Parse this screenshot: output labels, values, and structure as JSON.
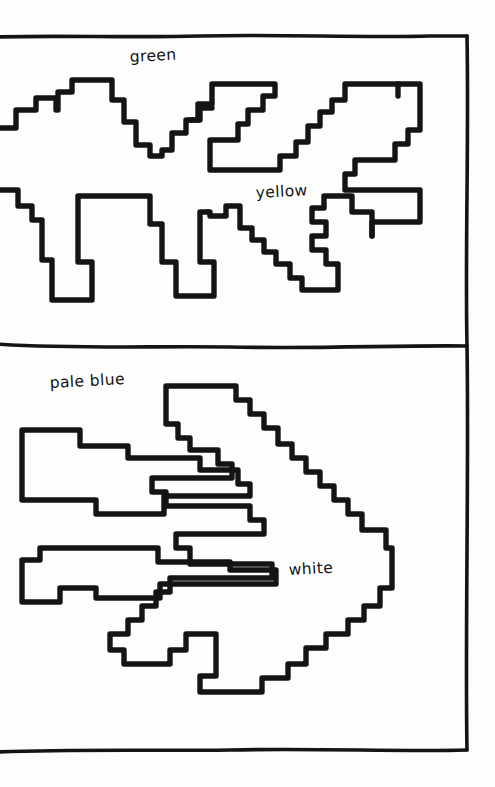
{
  "document": {
    "title": "Hand-drawn two-panel region map",
    "background_color": "#fdfdfc",
    "ink_color": "#141414",
    "width": 495,
    "height": 787
  },
  "panels": [
    {
      "id": "top-panel",
      "name": "upper-panel",
      "bounds": {
        "x": 0,
        "y": 36,
        "width": 468,
        "height": 309
      },
      "labels": [
        {
          "id": "green",
          "text": "green",
          "x": 130,
          "y": 62,
          "rotate": -3
        },
        {
          "id": "yellow",
          "text": "yellow",
          "x": 256,
          "y": 198,
          "rotate": -3
        }
      ]
    },
    {
      "id": "bottom-panel",
      "name": "lower-panel",
      "bounds": {
        "x": 0,
        "y": 345,
        "width": 468,
        "height": 405
      },
      "labels": [
        {
          "id": "pale-blue",
          "text": "pale blue",
          "x": 50,
          "y": 388,
          "rotate": -3
        },
        {
          "id": "white",
          "text": "white",
          "x": 289,
          "y": 575,
          "rotate": -3
        }
      ]
    }
  ],
  "frame": {
    "top_rule_y": 37,
    "middle_rule_y": 345,
    "bottom_rule_y": 750,
    "right_rule_x": 467
  },
  "regions": [
    {
      "id": "green-region",
      "label": "green",
      "panel": "top-panel"
    },
    {
      "id": "yellow-region",
      "label": "yellow",
      "panel": "top-panel"
    },
    {
      "id": "pale-blue-region",
      "label": "pale blue",
      "panel": "bottom-panel"
    },
    {
      "id": "white-region",
      "label": "white",
      "panel": "bottom-panel"
    }
  ],
  "colors": {
    "ink": "#141414",
    "paper": "#fdfdfc"
  }
}
